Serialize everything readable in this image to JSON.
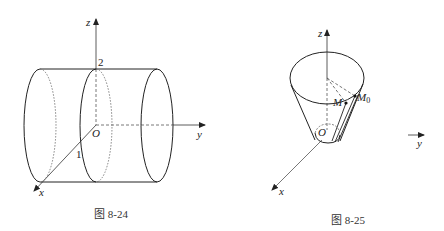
{
  "figures": [
    {
      "caption": "图 8-24",
      "description": "Cylinder of radius 1 along the y-axis",
      "axes": {
        "x": "x",
        "y": "y",
        "z": "z",
        "origin": "O"
      },
      "labels": {
        "height_mark": "2",
        "radius_mark": "1"
      }
    },
    {
      "caption": "图 8-25",
      "description": "Truncated cone opening upward about the z-axis",
      "axes": {
        "x": "x",
        "y": "y",
        "z": "z",
        "origin": "O"
      },
      "points": {
        "m": "M",
        "m0": "M",
        "m0_sub": "0"
      }
    }
  ]
}
